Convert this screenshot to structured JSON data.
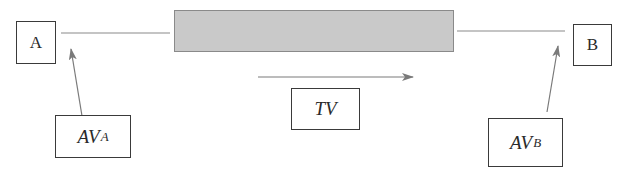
{
  "diagram": {
    "colors": {
      "line": "#7a7a7a",
      "arrow": "#7a7a7a",
      "box_border": "#3a3a3a",
      "bar_fill": "#c9c9c9",
      "bar_border": "#8a8a8a",
      "text": "#2a2a2a"
    },
    "nodes": {
      "a": {
        "label": "A"
      },
      "b": {
        "label": "B"
      },
      "av_a": {
        "main": "AV",
        "sub": "A"
      },
      "av_b": {
        "main": "AV",
        "sub": "B"
      },
      "tv": {
        "label": "TV"
      }
    },
    "bar": {
      "label": ""
    },
    "edges": [
      {
        "from": "A",
        "to": "bar",
        "type": "line"
      },
      {
        "from": "bar",
        "to": "B",
        "type": "line"
      },
      {
        "from": "AV_A",
        "to": "A-line",
        "type": "arrow"
      },
      {
        "from": "AV_B",
        "to": "B-line",
        "type": "arrow"
      },
      {
        "from": "left",
        "to": "right",
        "type": "arrow",
        "label": "TV"
      }
    ]
  }
}
